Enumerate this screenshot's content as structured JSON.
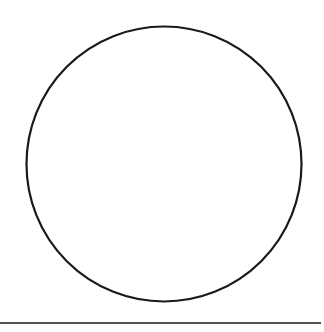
{
  "diagram": {
    "background": "#ffffff",
    "stroke_color": "#1a1a1a",
    "shapes": [
      {
        "type": "circle",
        "name": "circle",
        "cx": 164,
        "cy": 164,
        "r": 137.5,
        "stroke_width": 2.2,
        "fill": "none"
      },
      {
        "type": "line",
        "name": "baseline",
        "x1": 0,
        "y1": 323,
        "x2": 321,
        "y2": 323,
        "stroke_width": 1.6
      }
    ]
  }
}
